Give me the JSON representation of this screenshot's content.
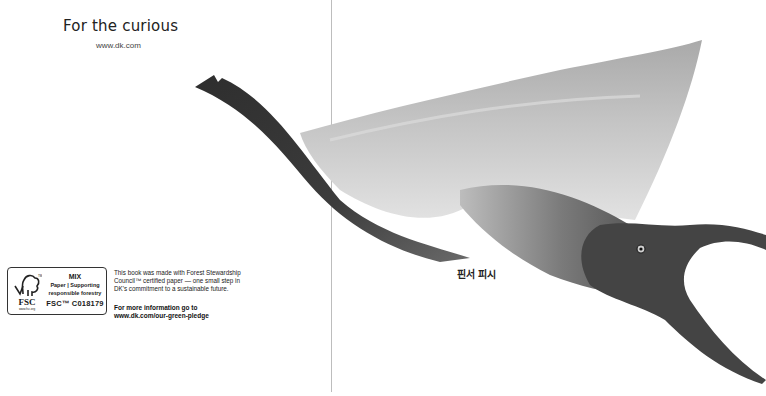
{
  "left_page": {
    "title": "For the curious",
    "url": "www.dk.com",
    "fsc": {
      "logo_word": "FSC",
      "logo_site": "www.fsc.org",
      "mix": "MIX",
      "paper_line1": "Paper | Supporting",
      "paper_line2": "responsible forestry",
      "code": "FSC™ C018179"
    },
    "blurb": "This book was made with Forest Stewardship Council™ certified paper — one small step in DK's commitment to a sustainable future.",
    "more_info_line1": "For more information go to",
    "more_info_line2": "www.dk.com/our-green-pledge"
  },
  "right_page": {
    "caption": "핀서 피시",
    "illustration": "pterosaur-illustration",
    "colors": {
      "crest_dark": "#2a2a2a",
      "wing_light": "#cfcfcf",
      "wing_mid": "#a8a8a8",
      "body_dark": "#3a3a3a"
    }
  },
  "spine": {
    "color": "#bdbdbd"
  }
}
